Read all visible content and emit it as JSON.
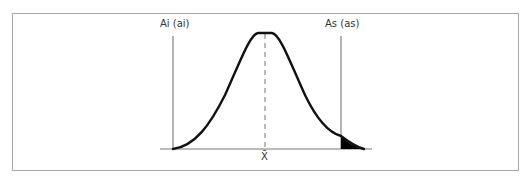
{
  "diagram": {
    "type": "normal-distribution-with-spec-limits",
    "labels": {
      "lower_limit": "Ai (ai)",
      "upper_limit": "As (as)",
      "mean": "X̄"
    },
    "colors": {
      "curve": "#111111",
      "limit_lines": "#555555",
      "baseline": "#777777",
      "mean_line": "#777777",
      "frame": "#a9a9a9",
      "tail_fill": "#000000"
    },
    "annotations": {
      "shaded_region": "upper tail beyond As"
    }
  }
}
